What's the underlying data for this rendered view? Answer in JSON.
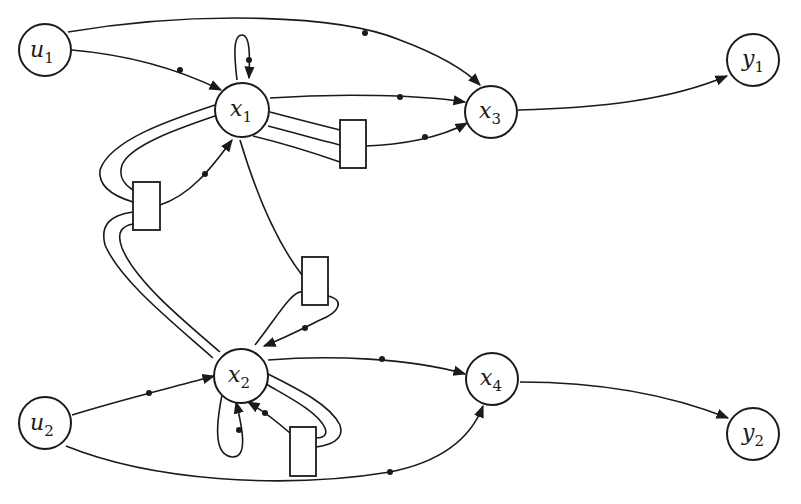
{
  "diagram": {
    "type": "signal-flow graph / structure digraph",
    "nodes": [
      {
        "id": "u1",
        "base": "u",
        "sub": "1",
        "role": "input"
      },
      {
        "id": "u2",
        "base": "u",
        "sub": "2",
        "role": "input"
      },
      {
        "id": "x1",
        "base": "x",
        "sub": "1",
        "role": "state"
      },
      {
        "id": "x2",
        "base": "x",
        "sub": "2",
        "role": "state"
      },
      {
        "id": "x3",
        "base": "x",
        "sub": "3",
        "role": "state"
      },
      {
        "id": "x4",
        "base": "x",
        "sub": "4",
        "role": "state"
      },
      {
        "id": "y1",
        "base": "y",
        "sub": "1",
        "role": "output"
      },
      {
        "id": "y2",
        "base": "y",
        "sub": "2",
        "role": "output"
      }
    ],
    "edges": [
      {
        "from": "u1",
        "to": "x1"
      },
      {
        "from": "u1",
        "to": "x3"
      },
      {
        "from": "x1",
        "to": "x1",
        "kind": "self-loop"
      },
      {
        "from": "x1",
        "to": "x3"
      },
      {
        "from": "x1",
        "to": "x3",
        "via": "box-a"
      },
      {
        "from": "x1",
        "to": "x1",
        "via": "box-b"
      },
      {
        "from": "x2",
        "to": "x1",
        "via": "box-b"
      },
      {
        "from": "x1",
        "to": "x2",
        "via": "box-c"
      },
      {
        "from": "x2",
        "to": "x2",
        "via": "box-c"
      },
      {
        "from": "x2",
        "to": "x2",
        "kind": "self-loop"
      },
      {
        "from": "x2",
        "to": "x2",
        "via": "box-d"
      },
      {
        "from": "u2",
        "to": "x2"
      },
      {
        "from": "u2",
        "to": "x4"
      },
      {
        "from": "x2",
        "to": "x4"
      },
      {
        "from": "x3",
        "to": "y1"
      },
      {
        "from": "x4",
        "to": "y2"
      }
    ],
    "boxes": [
      "box-a",
      "box-b",
      "box-c",
      "box-d"
    ]
  }
}
